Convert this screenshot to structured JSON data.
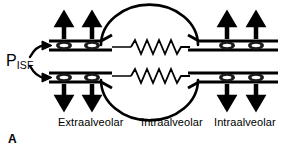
{
  "figure": {
    "panel_letter": "A",
    "pressure_label": {
      "symbol": "P",
      "subscript": "ISF"
    },
    "region_labels": [
      {
        "text": "Extraalveolar",
        "x": 58,
        "y": 118
      },
      {
        "text": "Intraalveolar",
        "x": 141,
        "y": 118
      },
      {
        "text": "Intraalveolar",
        "x": 214,
        "y": 118
      }
    ],
    "colors": {
      "stroke": "#000000",
      "background": "#ffffff",
      "vessel_wall": "#111111",
      "cell_fill": "#3a3a3a"
    },
    "elements": {
      "alveolus_label": "alveolus-circle",
      "resistor_label": "capillary-resistor",
      "arrow_up_count": 4,
      "arrow_down_count": 4,
      "cell_count": 8
    }
  }
}
